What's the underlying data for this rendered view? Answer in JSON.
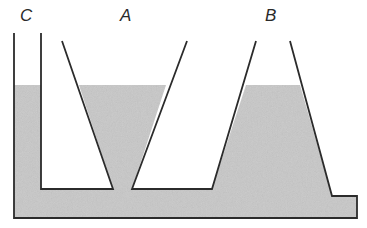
{
  "diagram": {
    "type": "communicating vessels",
    "labels": {
      "c": "C",
      "a": "A",
      "b": "B"
    },
    "colors": {
      "liquid": "#c8c8c8",
      "outline": "#2b2b2b",
      "background": "#ffffff"
    },
    "liquid_level_y": 85
  }
}
